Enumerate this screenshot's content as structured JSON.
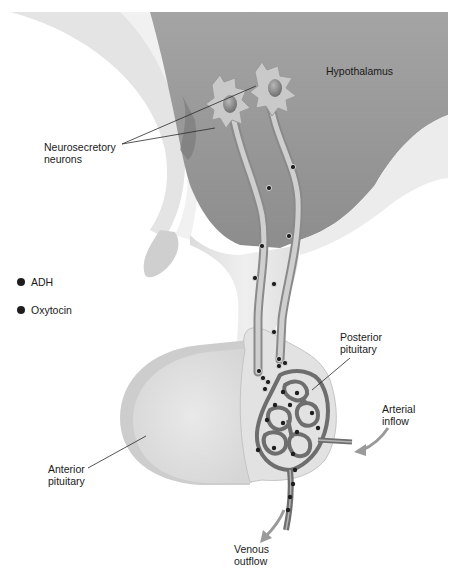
{
  "figure": {
    "labels": {
      "hypothalamus": "Hypothalamus",
      "neurosecretory_neurons": "Neurosecretory\nneurons",
      "posterior_pituitary": "Posterior\npituitary",
      "anterior_pituitary": "Anterior\npituitary",
      "arterial_inflow": "Arterial\ninflow",
      "venous_outflow": "Venous\noutflow"
    },
    "legend": [
      {
        "label": "ADH",
        "color": "#1e1e1e"
      },
      {
        "label": "Oxytocin",
        "color": "#1e1e1e"
      }
    ],
    "colors": {
      "hypothalamus_fill": "#a9a9a9",
      "tissue_light": "#e6e6e6",
      "tissue_mid": "#c4c4c4",
      "capillary": "#6e6e6e",
      "arrow": "#9a9a9a",
      "granule": "#1e1e1e"
    }
  }
}
